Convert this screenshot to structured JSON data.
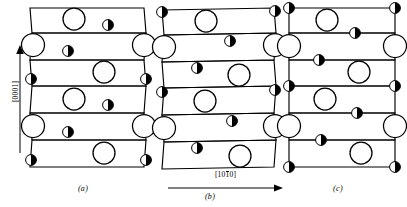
{
  "figure": {
    "type": "crystal-structure-stacking-diagram",
    "axes": {
      "vertical": {
        "label_prefix": "[000",
        "label_suffix": "1]",
        "label": "[0001]",
        "direction": "up"
      },
      "horizontal": {
        "label_pre": "[10",
        "label_overbar": "1",
        "label_post": "0]",
        "label": "[10̅0]",
        "direction": "right"
      }
    },
    "captions": {
      "a": "(a)",
      "b": "(b)",
      "c": "(c)"
    },
    "legend": {
      "large_open_circle": "large-open-atom",
      "small_half_filled_circle": "small-half-filled-atom"
    },
    "colors": {
      "line": "#000000",
      "fill_open": "#ffffff",
      "fill_half": "#000000"
    },
    "panels": [
      {
        "id": "a",
        "name": "panel-a",
        "cells": 6,
        "rows": [
          {
            "index": 0,
            "slant": "right",
            "large": [
              {
                "x": 0.34,
                "y": 0.3
              }
            ],
            "small": [
              {
                "x": 0.66,
                "y": 0.6
              }
            ]
          },
          {
            "index": 1,
            "slant": "left",
            "large": [
              {
                "x": 0.02,
                "y": 0.18
              },
              {
                "x": 0.98,
                "y": 0.18
              }
            ],
            "small": [
              {
                "x": 0.36,
                "y": 0.68
              }
            ]
          },
          {
            "index": 2,
            "slant": "right",
            "large": [
              {
                "x": 0.64,
                "y": 0.32
              }
            ],
            "small": [
              {
                "x": 0.02,
                "y": 0.78
              },
              {
                "x": 0.98,
                "y": 0.78
              }
            ]
          },
          {
            "index": 3,
            "slant": "right",
            "large": [
              {
                "x": 0.34,
                "y": 0.3
              }
            ],
            "small": [
              {
                "x": 0.66,
                "y": 0.6
              }
            ]
          },
          {
            "index": 4,
            "slant": "left",
            "large": [
              {
                "x": 0.02,
                "y": 0.18
              },
              {
                "x": 0.98,
                "y": 0.18
              }
            ],
            "small": [
              {
                "x": 0.36,
                "y": 0.68
              }
            ]
          },
          {
            "index": 5,
            "slant": "right",
            "large": [
              {
                "x": 0.64,
                "y": 0.32
              }
            ],
            "small": [
              {
                "x": 0.02,
                "y": 0.78
              },
              {
                "x": 0.98,
                "y": 0.78
              }
            ]
          }
        ]
      },
      {
        "id": "b",
        "name": "panel-b",
        "cells": 6,
        "rows": [
          {
            "index": 0,
            "slant": "right",
            "large": [
              {
                "x": 0.38,
                "y": 0.42
              }
            ],
            "small": [
              {
                "x": 0.02,
                "y": 0.12
              },
              {
                "x": 0.98,
                "y": 0.12
              }
            ]
          },
          {
            "index": 1,
            "slant": "left",
            "large": [
              {
                "x": 0.02,
                "y": 0.22
              },
              {
                "x": 0.98,
                "y": 0.22
              }
            ],
            "small": [
              {
                "x": 0.58,
                "y": 0.14
              }
            ]
          },
          {
            "index": 2,
            "slant": "right",
            "large": [
              {
                "x": 0.66,
                "y": 0.55
              }
            ],
            "small": [
              {
                "x": 0.3,
                "y": 0.24
              }
            ]
          },
          {
            "index": 3,
            "slant": "right",
            "large": [
              {
                "x": 0.36,
                "y": 0.46
              }
            ],
            "small": [
              {
                "x": 0.02,
                "y": 0.14
              },
              {
                "x": 0.98,
                "y": 0.14
              }
            ]
          },
          {
            "index": 4,
            "slant": "left",
            "large": [
              {
                "x": 0.02,
                "y": 0.26
              },
              {
                "x": 0.98,
                "y": 0.26
              }
            ],
            "small": [
              {
                "x": 0.6,
                "y": 0.16
              }
            ]
          },
          {
            "index": 5,
            "slant": "right",
            "large": [
              {
                "x": 0.68,
                "y": 0.62
              }
            ],
            "small": [
              {
                "x": 0.3,
                "y": 0.26
              }
            ]
          }
        ]
      },
      {
        "id": "c",
        "name": "panel-c",
        "cells": 6,
        "rows": [
          {
            "index": 0,
            "slant": "flat",
            "large": [
              {
                "x": 0.36,
                "y": 0.42
              }
            ],
            "small": [
              {
                "x": 0.02,
                "y": 0.02
              },
              {
                "x": 0.98,
                "y": 0.02
              },
              {
                "x": 0.62,
                "y": 0.98
              }
            ]
          },
          {
            "index": 1,
            "slant": "flat",
            "large": [
              {
                "x": 0.02,
                "y": 0.1
              },
              {
                "x": 0.98,
                "y": 0.1
              }
            ],
            "small": [
              {
                "x": 0.32,
                "y": 0.96
              }
            ]
          },
          {
            "index": 2,
            "slant": "flat",
            "large": [
              {
                "x": 0.66,
                "y": 0.4
              }
            ],
            "small": [
              {
                "x": 0.02,
                "y": 0.96
              },
              {
                "x": 0.98,
                "y": 0.96
              }
            ]
          },
          {
            "index": 3,
            "slant": "flat",
            "large": [
              {
                "x": 0.34,
                "y": 0.4
              }
            ],
            "small": [
              {
                "x": 0.64,
                "y": 0.97
              }
            ]
          },
          {
            "index": 4,
            "slant": "flat",
            "large": [
              {
                "x": 0.02,
                "y": 0.12
              },
              {
                "x": 0.98,
                "y": 0.12
              }
            ],
            "small": [
              {
                "x": 0.32,
                "y": 0.96
              }
            ]
          },
          {
            "index": 5,
            "slant": "flat",
            "large": [
              {
                "x": 0.66,
                "y": 0.42
              }
            ],
            "small": [
              {
                "x": 0.02,
                "y": 0.97
              },
              {
                "x": 0.98,
                "y": 0.97
              }
            ]
          }
        ]
      }
    ]
  }
}
